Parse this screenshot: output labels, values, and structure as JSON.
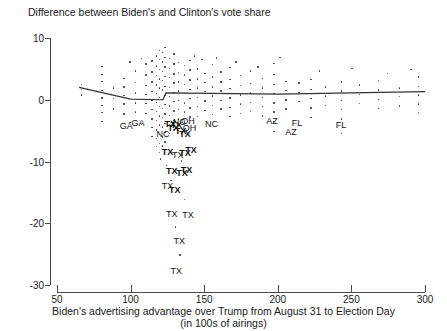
{
  "chart_data": {
    "type": "scatter",
    "title": "Difference between Biden's and Clinton's vote share",
    "xlabel_line1": "Biden's advertising advantage over Trump from August 31 to Election Day",
    "xlabel_line2": "(in 100s of airings)",
    "ylabel": "",
    "xlim": [
      50,
      300
    ],
    "ylim": [
      -30,
      10
    ],
    "xticks": [
      50,
      100,
      150,
      200,
      250,
      300
    ],
    "yticks": [
      10,
      0,
      -10,
      -20,
      -30
    ],
    "grid": false,
    "legend": null,
    "point_color": "#3a3a3a",
    "trend_color": "#333333",
    "trendline": {
      "name": "fitted trend",
      "points": [
        {
          "x": 65,
          "y": 2.0
        },
        {
          "x": 100,
          "y": 0.1
        },
        {
          "x": 122,
          "y": 0.0
        },
        {
          "x": 124,
          "y": 1.1
        },
        {
          "x": 200,
          "y": 0.9
        },
        {
          "x": 300,
          "y": 1.3
        }
      ]
    },
    "annotations": [
      {
        "label": "GA",
        "x": 97,
        "y": -4.2,
        "bold": false
      },
      {
        "label": "GA",
        "x": 105,
        "y": -3.8,
        "bold": false
      },
      {
        "label": "NC",
        "x": 122,
        "y": -5.6,
        "bold": false
      },
      {
        "label": "TX",
        "x": 127,
        "y": -3.9,
        "bold": true
      },
      {
        "label": "TX",
        "x": 129,
        "y": -4.6,
        "bold": true
      },
      {
        "label": "TX",
        "x": 131,
        "y": -4.1,
        "bold": true
      },
      {
        "label": "NC",
        "x": 133,
        "y": -3.6,
        "bold": false
      },
      {
        "label": "OH",
        "x": 139,
        "y": -3.5,
        "bold": false
      },
      {
        "label": "OH",
        "x": 140,
        "y": -4.6,
        "bold": false
      },
      {
        "label": "TX",
        "x": 134,
        "y": -5.0,
        "bold": true
      },
      {
        "label": "TX",
        "x": 137,
        "y": -5.5,
        "bold": true
      },
      {
        "label": "NC",
        "x": 155,
        "y": -3.9,
        "bold": false
      },
      {
        "label": "TX",
        "x": 125,
        "y": -8.4,
        "bold": true
      },
      {
        "label": "TX",
        "x": 132,
        "y": -9.0,
        "bold": false
      },
      {
        "label": "TX",
        "x": 137,
        "y": -8.6,
        "bold": true
      },
      {
        "label": "TX",
        "x": 141,
        "y": -8.2,
        "bold": true
      },
      {
        "label": "TX",
        "x": 128,
        "y": -11.5,
        "bold": true
      },
      {
        "label": "TX",
        "x": 135,
        "y": -11.8,
        "bold": true
      },
      {
        "label": "TX",
        "x": 138,
        "y": -11.3,
        "bold": true
      },
      {
        "label": "TX",
        "x": 125,
        "y": -14.0,
        "bold": false
      },
      {
        "label": "TX",
        "x": 130,
        "y": -14.6,
        "bold": true
      },
      {
        "label": "TX",
        "x": 128,
        "y": -18.5,
        "bold": false
      },
      {
        "label": "TX",
        "x": 139,
        "y": -18.7,
        "bold": false
      },
      {
        "label": "TX",
        "x": 133,
        "y": -22.9,
        "bold": false
      },
      {
        "label": "TX",
        "x": 131,
        "y": -27.8,
        "bold": false
      },
      {
        "label": "AZ",
        "x": 196,
        "y": -3.5,
        "bold": false
      },
      {
        "label": "FL",
        "x": 213,
        "y": -3.7,
        "bold": false
      },
      {
        "label": "AZ",
        "x": 209,
        "y": -5.3,
        "bold": false
      },
      {
        "label": "FL",
        "x": 243,
        "y": -4.1,
        "bold": false
      }
    ],
    "points": [
      {
        "x": 66,
        "y": 1.8
      },
      {
        "x": 66,
        "y": 0.9
      },
      {
        "x": 66,
        "y": 2.6
      },
      {
        "x": 80,
        "y": 4.2
      },
      {
        "x": 80,
        "y": 3.1
      },
      {
        "x": 80,
        "y": 1.6
      },
      {
        "x": 80,
        "y": 0.4
      },
      {
        "x": 80,
        "y": -0.8
      },
      {
        "x": 80,
        "y": -2.0
      },
      {
        "x": 80,
        "y": -3.4
      },
      {
        "x": 80,
        "y": 5.5
      },
      {
        "x": 95,
        "y": 3.6
      },
      {
        "x": 95,
        "y": 2.2
      },
      {
        "x": 95,
        "y": 0.8
      },
      {
        "x": 95,
        "y": -0.6
      },
      {
        "x": 95,
        "y": -2.2
      },
      {
        "x": 103,
        "y": 4.8
      },
      {
        "x": 103,
        "y": 2.9
      },
      {
        "x": 103,
        "y": 1.2
      },
      {
        "x": 103,
        "y": -0.4
      },
      {
        "x": 103,
        "y": -1.9
      },
      {
        "x": 110,
        "y": 5.9
      },
      {
        "x": 110,
        "y": 4.1
      },
      {
        "x": 110,
        "y": 2.4
      },
      {
        "x": 110,
        "y": 1.0
      },
      {
        "x": 110,
        "y": -0.5
      },
      {
        "x": 110,
        "y": -2.1
      },
      {
        "x": 114,
        "y": 6.4
      },
      {
        "x": 114,
        "y": 4.6
      },
      {
        "x": 114,
        "y": 3.0
      },
      {
        "x": 114,
        "y": 1.4
      },
      {
        "x": 114,
        "y": 0.0
      },
      {
        "x": 114,
        "y": -1.5
      },
      {
        "x": 114,
        "y": -3.0
      },
      {
        "x": 114,
        "y": -4.4
      },
      {
        "x": 114,
        "y": -5.8
      },
      {
        "x": 117,
        "y": 7.2
      },
      {
        "x": 117,
        "y": 5.6
      },
      {
        "x": 117,
        "y": 4.0
      },
      {
        "x": 117,
        "y": 2.5
      },
      {
        "x": 117,
        "y": 1.1
      },
      {
        "x": 117,
        "y": -0.3
      },
      {
        "x": 117,
        "y": -1.8
      },
      {
        "x": 117,
        "y": -3.2
      },
      {
        "x": 117,
        "y": -4.8
      },
      {
        "x": 117,
        "y": -6.2
      },
      {
        "x": 117,
        "y": -7.5
      },
      {
        "x": 119,
        "y": 8.1
      },
      {
        "x": 119,
        "y": 6.6
      },
      {
        "x": 119,
        "y": 5.0
      },
      {
        "x": 119,
        "y": 3.5
      },
      {
        "x": 119,
        "y": 2.0
      },
      {
        "x": 119,
        "y": 0.5
      },
      {
        "x": 119,
        "y": -1.0
      },
      {
        "x": 119,
        "y": -2.5
      },
      {
        "x": 119,
        "y": -4.0
      },
      {
        "x": 119,
        "y": -5.5
      },
      {
        "x": 119,
        "y": -7.0
      },
      {
        "x": 119,
        "y": -8.4
      },
      {
        "x": 121,
        "y": 7.8
      },
      {
        "x": 121,
        "y": 6.2
      },
      {
        "x": 121,
        "y": 4.7
      },
      {
        "x": 121,
        "y": 3.2
      },
      {
        "x": 121,
        "y": 1.7
      },
      {
        "x": 121,
        "y": 0.2
      },
      {
        "x": 121,
        "y": -1.3
      },
      {
        "x": 121,
        "y": -2.8
      },
      {
        "x": 121,
        "y": -4.3
      },
      {
        "x": 121,
        "y": -5.9
      },
      {
        "x": 121,
        "y": -7.4
      },
      {
        "x": 123,
        "y": 8.6
      },
      {
        "x": 123,
        "y": 7.0
      },
      {
        "x": 123,
        "y": 5.4
      },
      {
        "x": 123,
        "y": 3.9
      },
      {
        "x": 123,
        "y": 2.3
      },
      {
        "x": 123,
        "y": 0.8
      },
      {
        "x": 123,
        "y": -0.7
      },
      {
        "x": 123,
        "y": -2.2
      },
      {
        "x": 123,
        "y": -3.7
      },
      {
        "x": 123,
        "y": -5.2
      },
      {
        "x": 123,
        "y": -6.7
      },
      {
        "x": 126,
        "y": 6.8
      },
      {
        "x": 126,
        "y": 5.2
      },
      {
        "x": 126,
        "y": 3.7
      },
      {
        "x": 126,
        "y": 2.1
      },
      {
        "x": 126,
        "y": 0.6
      },
      {
        "x": 126,
        "y": -0.9
      },
      {
        "x": 126,
        "y": -2.4
      },
      {
        "x": 126,
        "y": -3.9
      },
      {
        "x": 126,
        "y": -5.4
      },
      {
        "x": 129,
        "y": 7.5
      },
      {
        "x": 129,
        "y": 5.9
      },
      {
        "x": 129,
        "y": 4.3
      },
      {
        "x": 129,
        "y": 2.8
      },
      {
        "x": 129,
        "y": 1.3
      },
      {
        "x": 129,
        "y": -0.2
      },
      {
        "x": 129,
        "y": -1.7
      },
      {
        "x": 129,
        "y": -3.2
      },
      {
        "x": 129,
        "y": -4.7
      },
      {
        "x": 132,
        "y": 6.1
      },
      {
        "x": 132,
        "y": 4.5
      },
      {
        "x": 132,
        "y": 3.0
      },
      {
        "x": 132,
        "y": 1.5
      },
      {
        "x": 132,
        "y": 0.0
      },
      {
        "x": 132,
        "y": -1.5
      },
      {
        "x": 132,
        "y": -3.0
      },
      {
        "x": 136,
        "y": 5.7
      },
      {
        "x": 136,
        "y": 4.1
      },
      {
        "x": 136,
        "y": 2.6
      },
      {
        "x": 136,
        "y": 1.1
      },
      {
        "x": 136,
        "y": -0.4
      },
      {
        "x": 136,
        "y": -1.9
      },
      {
        "x": 136,
        "y": -3.5
      },
      {
        "x": 140,
        "y": 6.5
      },
      {
        "x": 140,
        "y": 4.9
      },
      {
        "x": 140,
        "y": 3.3
      },
      {
        "x": 140,
        "y": 1.8
      },
      {
        "x": 140,
        "y": 0.3
      },
      {
        "x": 140,
        "y": -1.2
      },
      {
        "x": 140,
        "y": -2.7
      },
      {
        "x": 145,
        "y": 5.1
      },
      {
        "x": 145,
        "y": 3.5
      },
      {
        "x": 145,
        "y": 2.0
      },
      {
        "x": 145,
        "y": 0.5
      },
      {
        "x": 145,
        "y": -1.0
      },
      {
        "x": 145,
        "y": -2.6
      },
      {
        "x": 150,
        "y": 4.4
      },
      {
        "x": 150,
        "y": 2.9
      },
      {
        "x": 150,
        "y": 1.4
      },
      {
        "x": 150,
        "y": -0.1
      },
      {
        "x": 150,
        "y": -1.6
      },
      {
        "x": 155,
        "y": 5.8
      },
      {
        "x": 155,
        "y": 3.8
      },
      {
        "x": 155,
        "y": 2.2
      },
      {
        "x": 155,
        "y": 0.7
      },
      {
        "x": 155,
        "y": -0.8
      },
      {
        "x": 155,
        "y": -2.3
      },
      {
        "x": 161,
        "y": 4.6
      },
      {
        "x": 161,
        "y": 3.0
      },
      {
        "x": 161,
        "y": 1.5
      },
      {
        "x": 161,
        "y": 0.0
      },
      {
        "x": 161,
        "y": -1.4
      },
      {
        "x": 167,
        "y": 5.3
      },
      {
        "x": 167,
        "y": 3.4
      },
      {
        "x": 167,
        "y": 1.9
      },
      {
        "x": 167,
        "y": 0.4
      },
      {
        "x": 167,
        "y": -1.1
      },
      {
        "x": 167,
        "y": -2.6
      },
      {
        "x": 174,
        "y": 4.0
      },
      {
        "x": 174,
        "y": 2.4
      },
      {
        "x": 174,
        "y": 0.9
      },
      {
        "x": 174,
        "y": -0.6
      },
      {
        "x": 174,
        "y": -2.1
      },
      {
        "x": 181,
        "y": 4.8
      },
      {
        "x": 181,
        "y": 2.7
      },
      {
        "x": 181,
        "y": 1.2
      },
      {
        "x": 181,
        "y": -0.3
      },
      {
        "x": 181,
        "y": -1.8
      },
      {
        "x": 189,
        "y": 3.6
      },
      {
        "x": 189,
        "y": 2.0
      },
      {
        "x": 189,
        "y": 0.5
      },
      {
        "x": 189,
        "y": -1.0
      },
      {
        "x": 189,
        "y": -2.5
      },
      {
        "x": 197,
        "y": 6.0
      },
      {
        "x": 197,
        "y": 4.2
      },
      {
        "x": 197,
        "y": 2.6
      },
      {
        "x": 197,
        "y": 1.1
      },
      {
        "x": 197,
        "y": -0.4
      },
      {
        "x": 197,
        "y": -1.9
      },
      {
        "x": 197,
        "y": -3.4
      },
      {
        "x": 197,
        "y": -5.0
      },
      {
        "x": 205,
        "y": 3.1
      },
      {
        "x": 205,
        "y": 1.6
      },
      {
        "x": 205,
        "y": 0.1
      },
      {
        "x": 205,
        "y": -1.4
      },
      {
        "x": 214,
        "y": 2.8
      },
      {
        "x": 214,
        "y": 1.3
      },
      {
        "x": 214,
        "y": -0.2
      },
      {
        "x": 222,
        "y": 3.4
      },
      {
        "x": 222,
        "y": 1.8
      },
      {
        "x": 222,
        "y": 0.3
      },
      {
        "x": 222,
        "y": -1.2
      },
      {
        "x": 222,
        "y": -2.8
      },
      {
        "x": 232,
        "y": 2.2
      },
      {
        "x": 232,
        "y": 0.7
      },
      {
        "x": 232,
        "y": -0.8
      },
      {
        "x": 243,
        "y": 3.0
      },
      {
        "x": 243,
        "y": 1.5
      },
      {
        "x": 243,
        "y": 0.0
      },
      {
        "x": 243,
        "y": -1.5
      },
      {
        "x": 243,
        "y": -3.0
      },
      {
        "x": 243,
        "y": -5.4
      },
      {
        "x": 255,
        "y": 2.5
      },
      {
        "x": 255,
        "y": 1.0
      },
      {
        "x": 255,
        "y": -0.5
      },
      {
        "x": 268,
        "y": 3.2
      },
      {
        "x": 268,
        "y": 1.7
      },
      {
        "x": 268,
        "y": 0.2
      },
      {
        "x": 268,
        "y": -1.3
      },
      {
        "x": 282,
        "y": 2.0
      },
      {
        "x": 282,
        "y": 0.6
      },
      {
        "x": 282,
        "y": -0.9
      },
      {
        "x": 295,
        "y": 3.8
      },
      {
        "x": 295,
        "y": 2.3
      },
      {
        "x": 295,
        "y": 0.9
      },
      {
        "x": 295,
        "y": -0.6
      },
      {
        "x": 295,
        "y": -2.0
      },
      {
        "x": 88,
        "y": 2.0
      },
      {
        "x": 88,
        "y": 0.3
      },
      {
        "x": 88,
        "y": -1.4
      },
      {
        "x": 99,
        "y": 6.2
      },
      {
        "x": 99,
        "y": -3.6
      },
      {
        "x": 107,
        "y": 6.8
      },
      {
        "x": 107,
        "y": -3.9
      },
      {
        "x": 143,
        "y": 7.2
      },
      {
        "x": 148,
        "y": 6.6
      },
      {
        "x": 158,
        "y": 6.9
      },
      {
        "x": 171,
        "y": 6.2
      },
      {
        "x": 186,
        "y": 5.4
      },
      {
        "x": 201,
        "y": 7.0
      },
      {
        "x": 228,
        "y": 4.8
      },
      {
        "x": 250,
        "y": 5.2
      },
      {
        "x": 274,
        "y": 4.4
      },
      {
        "x": 290,
        "y": 5.0
      },
      {
        "x": 120,
        "y": -9.5
      },
      {
        "x": 124,
        "y": -10.5
      },
      {
        "x": 134,
        "y": -9.8
      },
      {
        "x": 143,
        "y": -7.8
      },
      {
        "x": 127,
        "y": -13.0
      },
      {
        "x": 136,
        "y": -16.0
      },
      {
        "x": 130,
        "y": -20.5
      },
      {
        "x": 133,
        "y": -25.0
      }
    ]
  }
}
